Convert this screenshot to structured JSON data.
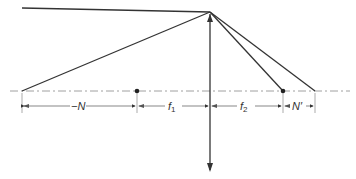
{
  "diagram": {
    "type": "thin-lens nodal points ray diagram",
    "colors": {
      "line": "#333333",
      "axis": "#888888",
      "background": "#ffffff"
    },
    "labels": {
      "neg_n": "−N",
      "f1": "f",
      "f1_sub": "1",
      "f2": "f",
      "f2_sub": "2",
      "n_prime": "N′"
    },
    "points": {
      "apex": [
        210,
        12
      ],
      "left_ray_start": [
        22,
        91
      ],
      "focal_point_1": [
        137,
        91
      ],
      "focal_point_2": [
        283,
        91
      ],
      "right_ray_end": [
        315,
        91
      ],
      "incoming_ray_start": [
        22,
        8
      ]
    }
  }
}
